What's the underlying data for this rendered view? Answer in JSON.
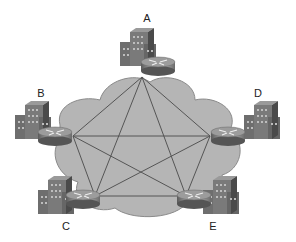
{
  "diagram": {
    "type": "full-mesh network",
    "colors": {
      "cloud": "#b3b3b3",
      "cloud_stroke": "#8a8a8a",
      "links": "#555555"
    },
    "nodes": [
      {
        "id": "A",
        "label": "A",
        "x": 142,
        "y": 77,
        "lx": 147,
        "ly": 22
      },
      {
        "id": "B",
        "label": "B",
        "x": 73,
        "y": 136,
        "lx": 41,
        "ly": 97
      },
      {
        "id": "D",
        "label": "D",
        "x": 210,
        "y": 136,
        "lx": 258,
        "ly": 97
      },
      {
        "id": "C",
        "label": "C",
        "x": 95,
        "y": 196,
        "lx": 66,
        "ly": 230
      },
      {
        "id": "E",
        "label": "E",
        "x": 186,
        "y": 196,
        "lx": 213,
        "ly": 230
      }
    ]
  }
}
